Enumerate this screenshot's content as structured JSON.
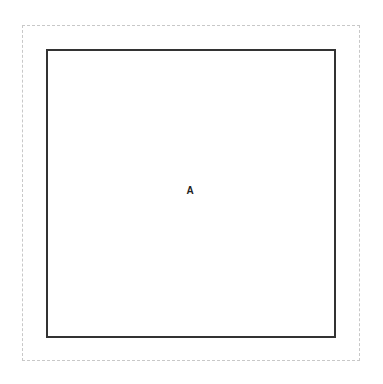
{
  "diagram": {
    "outer_boundary": {
      "style": "dashed",
      "color": "#c8c8c8"
    },
    "box": {
      "label": "A",
      "border_color": "#333333"
    }
  }
}
